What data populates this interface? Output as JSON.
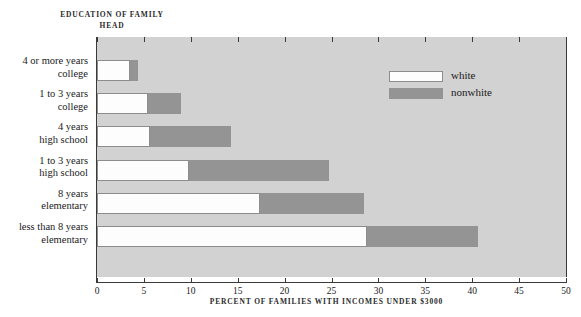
{
  "chart_data": {
    "type": "bar",
    "orientation": "horizontal",
    "stacked": false,
    "title": "",
    "header_caption": "EDUCATION OF FAMILY HEAD",
    "xlabel": "PERCENT OF FAMILIES WITH INCOMES UNDER $3000",
    "ylabel": "",
    "xlim": [
      0,
      50
    ],
    "xticks": [
      0,
      5,
      10,
      15,
      20,
      25,
      30,
      35,
      40,
      45,
      50
    ],
    "xtick_labels": [
      "0",
      "5",
      "10",
      "15",
      "20",
      "25",
      "30",
      "35",
      "40",
      "45",
      "50"
    ],
    "grid": false,
    "legend_position": "upper-right-inside",
    "categories": [
      "4 or more years college",
      "1 to 3 years college",
      "4 years high school",
      "1 to 3 years high school",
      "8 years elementary",
      "less than 8 years elementary"
    ],
    "category_lines": [
      [
        "4 or more years",
        "college"
      ],
      [
        "1 to 3 years",
        "college"
      ],
      [
        "4 years",
        "high school"
      ],
      [
        "1 to 3 years",
        "high school"
      ],
      [
        "8 years",
        "elementary"
      ],
      [
        "less than 8 years",
        "elementary"
      ]
    ],
    "series": [
      {
        "name": "white",
        "color": "#fdfdfd",
        "values": [
          3.5,
          5.4,
          5.7,
          9.8,
          17.4,
          28.8
        ]
      },
      {
        "name": "nonwhite",
        "color": "#949494",
        "values": [
          4.4,
          9.0,
          14.3,
          24.7,
          28.5,
          40.6
        ]
      }
    ],
    "note": "Each category shows two overlapping horizontal bars: the white bar drawn from 0 to its value, and the nonwhite bar drawn from 0 to its larger value, so the grey portion extends beyond the white one."
  },
  "legend": {
    "items": [
      {
        "label": "white",
        "swatch": "white"
      },
      {
        "label": "nonwhite",
        "swatch": "nonwhite"
      }
    ]
  },
  "colors": {
    "plot_background": "#d2d2d2",
    "page_background": "#ffffff",
    "axis": "#3a3a3a",
    "white_series": "#fdfdfd",
    "nonwhite_series": "#949494",
    "text": "#1a1a1a"
  }
}
